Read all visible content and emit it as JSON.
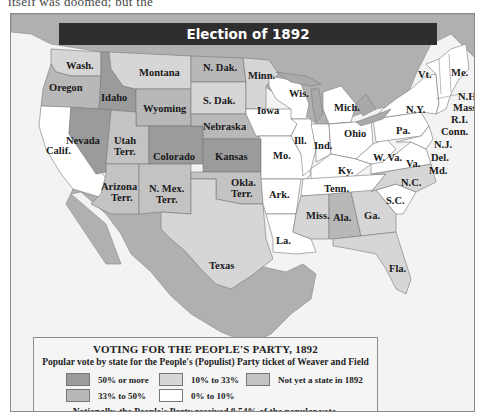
{
  "title": "Election of 1892",
  "top_text_fragment": "itself was doomed; but the",
  "colors": {
    "over_50": "#9b9b9b",
    "33_to_50": "#b8b8b8",
    "10_to_33": "#d6d6d6",
    "0_to_10": "#ffffff",
    "not_state": "#c3c3c3",
    "water": "#a9a9a9",
    "foreign": "#b0b0b0",
    "ocean": "#efefef"
  },
  "states": [
    {
      "label": "Wash.",
      "category": "10_to_33"
    },
    {
      "label": "Oregon",
      "category": "33_to_50"
    },
    {
      "label": "Calif.",
      "category": "0_to_10"
    },
    {
      "label": "Idaho",
      "category": "over_50"
    },
    {
      "label": "Nevada",
      "category": "over_50"
    },
    {
      "label": "Montana",
      "category": "10_to_33"
    },
    {
      "label": "Wyoming",
      "category": "33_to_50"
    },
    {
      "label": "Utah Terr.",
      "category": "not_state"
    },
    {
      "label": "Colorado",
      "category": "over_50"
    },
    {
      "label": "Arizona Terr.",
      "category": "not_state"
    },
    {
      "label": "N. Mex. Terr.",
      "category": "not_state"
    },
    {
      "label": "N. Dak.",
      "category": "33_to_50"
    },
    {
      "label": "S. Dak.",
      "category": "10_to_33"
    },
    {
      "label": "Nebraska",
      "category": "33_to_50"
    },
    {
      "label": "Kansas",
      "category": "over_50"
    },
    {
      "label": "Okla. Terr.",
      "category": "not_state"
    },
    {
      "label": "Texas",
      "category": "10_to_33"
    },
    {
      "label": "Minn.",
      "category": "10_to_33"
    },
    {
      "label": "Iowa",
      "category": "0_to_10"
    },
    {
      "label": "Mo.",
      "category": "0_to_10"
    },
    {
      "label": "Ark.",
      "category": "0_to_10"
    },
    {
      "label": "La.",
      "category": "0_to_10"
    },
    {
      "label": "Wis.",
      "category": "0_to_10"
    },
    {
      "label": "Ill.",
      "category": "0_to_10"
    },
    {
      "label": "Mich.",
      "category": "0_to_10"
    },
    {
      "label": "Ind.",
      "category": "0_to_10"
    },
    {
      "label": "Ohio",
      "category": "0_to_10"
    },
    {
      "label": "Ky.",
      "category": "0_to_10"
    },
    {
      "label": "Tenn.",
      "category": "0_to_10"
    },
    {
      "label": "Miss.",
      "category": "10_to_33"
    },
    {
      "label": "Ala.",
      "category": "33_to_50"
    },
    {
      "label": "Ga.",
      "category": "10_to_33"
    },
    {
      "label": "Fla.",
      "category": "10_to_33"
    },
    {
      "label": "S.C.",
      "category": "0_to_10"
    },
    {
      "label": "N.C.",
      "category": "10_to_33"
    },
    {
      "label": "Va.",
      "category": "0_to_10"
    },
    {
      "label": "W. Va.",
      "category": "0_to_10"
    },
    {
      "label": "Md.",
      "category": "0_to_10"
    },
    {
      "label": "Del.",
      "category": "0_to_10"
    },
    {
      "label": "N.J.",
      "category": "0_to_10"
    },
    {
      "label": "Pa.",
      "category": "0_to_10"
    },
    {
      "label": "N.Y.",
      "category": "0_to_10"
    },
    {
      "label": "Conn.",
      "category": "0_to_10"
    },
    {
      "label": "R.I.",
      "category": "0_to_10"
    },
    {
      "label": "Mass.",
      "category": "0_to_10"
    },
    {
      "label": "Vt.",
      "category": "0_to_10"
    },
    {
      "label": "N.H.",
      "category": "0_to_10"
    },
    {
      "label": "Me.",
      "category": "0_to_10"
    }
  ],
  "legend": {
    "title": "VOTING FOR THE PEOPLE'S PARTY, 1892",
    "subtitle": "Popular vote by state for the People's (Populist) Party ticket of Weaver and Field",
    "items": [
      {
        "label": "50% or more",
        "key": "over_50"
      },
      {
        "label": "33% to 50%",
        "key": "33_to_50"
      },
      {
        "label": "10% to 33%",
        "key": "10_to_33"
      },
      {
        "label": "0% to 10%",
        "key": "0_to_10"
      },
      {
        "label": "Not yet a state in 1892",
        "key": "not_state"
      }
    ],
    "note": "Nationally, the People's Party received 8.54% of the popular vote."
  }
}
